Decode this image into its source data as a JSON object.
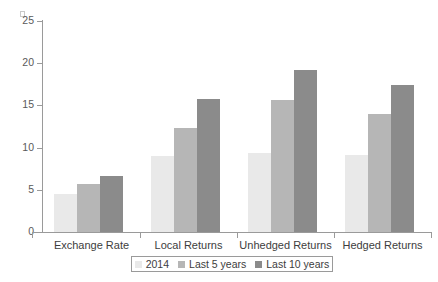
{
  "chart_data": {
    "type": "bar",
    "title": "",
    "subtitle": "",
    "xlabel": "",
    "ylabel": "",
    "categories": [
      "Exchange Rate",
      "Local Returns",
      "Unhedged Returns",
      "Hedged Returns"
    ],
    "series": [
      {
        "name": "2014",
        "color": "#e9e9e9",
        "values": [
          4.5,
          9.0,
          9.4,
          9.1
        ]
      },
      {
        "name": "Last 5 years",
        "color": "#b6b6b6",
        "values": [
          5.7,
          12.3,
          15.6,
          14.0
        ]
      },
      {
        "name": "Last 10 years",
        "color": "#8b8b8b",
        "values": [
          6.6,
          15.8,
          19.2,
          17.4
        ]
      }
    ],
    "ylim": [
      0,
      25
    ],
    "yticks": [
      0,
      5,
      10,
      15,
      20,
      25
    ],
    "ytick_labels": [
      "0",
      "5",
      "10",
      "15",
      "20",
      "25"
    ],
    "grid": false,
    "legend_position": "bottom"
  },
  "legend": {
    "items": [
      {
        "label": "2014",
        "color": "#e9e9e9"
      },
      {
        "label": "Last 5 years",
        "color": "#b6b6b6"
      },
      {
        "label": "Last 10 years",
        "color": "#8b8b8b"
      }
    ]
  }
}
